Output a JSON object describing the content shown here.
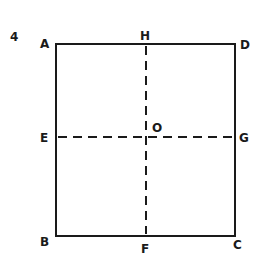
{
  "figure": {
    "number_label": "4",
    "shape": "rectangle",
    "vertices": {
      "A": "A",
      "B": "B",
      "C": "C",
      "D": "D"
    },
    "midpoints": {
      "H": "H",
      "F": "F",
      "E": "E",
      "G": "G"
    },
    "center": "O",
    "solid_edges": [
      "AD",
      "DC",
      "CB",
      "BA"
    ],
    "dashed_lines": [
      "HF",
      "EG"
    ],
    "line_color": "#1a1a1a",
    "background": "#ffffff"
  }
}
